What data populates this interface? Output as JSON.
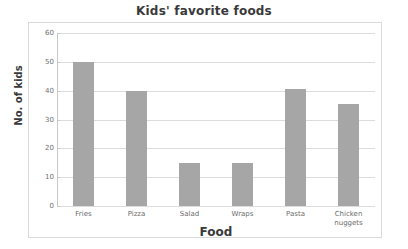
{
  "chart_data": {
    "type": "bar",
    "title": "Kids' favorite foods",
    "xlabel": "Food",
    "ylabel": "No. of kids",
    "categories": [
      "Fries",
      "Pizza",
      "Salad",
      "Wraps",
      "Pasta",
      "Chicken\nnuggets"
    ],
    "values": [
      50,
      40,
      15,
      15,
      40.5,
      35.5
    ],
    "ylim": [
      0,
      60
    ],
    "yticks": [
      0,
      10,
      20,
      30,
      40,
      50,
      60
    ],
    "ytick_labels": [
      "0",
      "10",
      "20",
      "30",
      "40",
      "50",
      "60"
    ],
    "grid": true,
    "legend": null,
    "bar_color": "#a6a6a6",
    "gridline_color": "#dcdcdc",
    "axis_color": "#c9c9c9",
    "frame_color": "#d9d9d9",
    "text_color": "#3a3a3a",
    "tick_text_color": "#707070"
  }
}
